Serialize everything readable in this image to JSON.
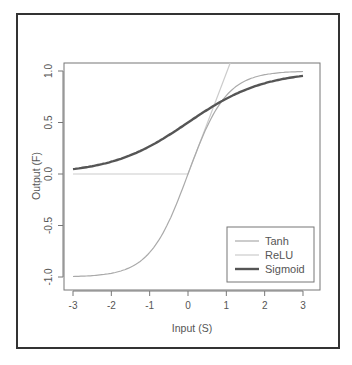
{
  "chart_data": {
    "type": "line",
    "title": "",
    "xlabel": "Input (S)",
    "ylabel": "Output (F)",
    "xlim": [
      -3.1,
      3.1
    ],
    "ylim": [
      -1.05,
      1.1
    ],
    "xticks": [
      "-3",
      "-2",
      "-1",
      "0",
      "1",
      "2",
      "3"
    ],
    "yticks": [
      "-1.0",
      "-0.5",
      "0.0",
      "0.5",
      "1.0"
    ],
    "grid": false,
    "legend_position": "bottom-right",
    "x": [
      -3,
      -2.5,
      -2,
      -1.5,
      -1,
      -0.5,
      0,
      0.5,
      1,
      1.5,
      2,
      2.5,
      3
    ],
    "series": [
      {
        "name": "Tanh",
        "color": "#aaaaaa",
        "values": [
          -0.995,
          -0.987,
          -0.964,
          -0.905,
          -0.762,
          -0.462,
          0.0,
          0.462,
          0.762,
          0.905,
          0.964,
          0.987,
          0.995
        ]
      },
      {
        "name": "ReLU",
        "color": "#cccccc",
        "values": [
          0,
          0,
          0,
          0,
          0,
          0,
          0,
          0.5,
          1.0,
          1.1,
          1.1,
          1.1,
          1.1
        ]
      },
      {
        "name": "Sigmoid",
        "color": "#555555",
        "values": [
          0.047,
          0.076,
          0.119,
          0.182,
          0.269,
          0.378,
          0.5,
          0.622,
          0.731,
          0.818,
          0.881,
          0.924,
          0.953
        ]
      }
    ]
  },
  "legend": {
    "items": [
      {
        "label": "Tanh",
        "color": "#aaaaaa"
      },
      {
        "label": "ReLU",
        "color": "#cccccc"
      },
      {
        "label": "Sigmoid",
        "color": "#555555"
      }
    ]
  },
  "axes": {
    "x_title": "Input (S)",
    "y_title": "Output (F)",
    "x_ticks": [
      "-3",
      "-2",
      "-1",
      "0",
      "1",
      "2",
      "3"
    ],
    "y_ticks": [
      "-1.0",
      "-0.5",
      "0.0",
      "0.5",
      "1.0"
    ]
  }
}
